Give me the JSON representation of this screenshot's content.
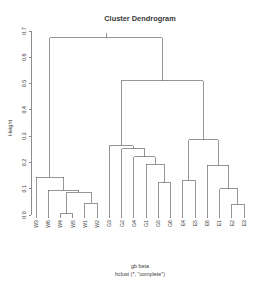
{
  "chart_data": {
    "type": "dendrogram",
    "title": "Cluster Dendrogram",
    "xlabel": "",
    "ylabel": "Height",
    "caption": {
      "line1": "gb beta",
      "line2": "hclust (*, \"complete\")"
    },
    "ylim": [
      0.0,
      0.7
    ],
    "yticks": [
      "0.0",
      "0.1",
      "0.2",
      "0.3",
      "0.4",
      "0.5",
      "0.6",
      "0.7"
    ],
    "ytick_values": [
      0.0,
      0.1,
      0.2,
      0.3,
      0.4,
      0.5,
      0.6,
      0.7
    ],
    "grid": false,
    "legend": "none",
    "leaf_order": [
      "W3",
      "W6",
      "W4",
      "W5",
      "W1",
      "W2",
      "G3",
      "G2",
      "G4",
      "G1",
      "G5",
      "G6",
      "E4",
      "E5",
      "E6",
      "E1",
      "E2",
      "E3"
    ],
    "leaf_count": 18,
    "merges": [
      {
        "id": "m1",
        "left": "W4",
        "right": "W5",
        "height": 0.005
      },
      {
        "id": "m2",
        "left": "W1",
        "right": "W2",
        "height": 0.044
      },
      {
        "id": "m3",
        "left": "m1",
        "right": "m2",
        "height": 0.086
      },
      {
        "id": "m4",
        "left": "W6",
        "right": "m3",
        "height": 0.095
      },
      {
        "id": "m5",
        "left": "W3",
        "right": "m4",
        "height": 0.144
      },
      {
        "id": "m6",
        "left": "G5",
        "right": "G6",
        "height": 0.122
      },
      {
        "id": "m7",
        "left": "G1",
        "right": "m6",
        "height": 0.194
      },
      {
        "id": "m8",
        "left": "G4",
        "right": "m7",
        "height": 0.222
      },
      {
        "id": "m9",
        "left": "G2",
        "right": "m8",
        "height": 0.253
      },
      {
        "id": "m10",
        "left": "G3",
        "right": "m9",
        "height": 0.263
      },
      {
        "id": "m11",
        "left": "E4",
        "right": "E5",
        "height": 0.133
      },
      {
        "id": "m12",
        "left": "E2",
        "right": "E3",
        "height": 0.04
      },
      {
        "id": "m13",
        "left": "E1",
        "right": "m12",
        "height": 0.1
      },
      {
        "id": "m14",
        "left": "E6",
        "right": "m13",
        "height": 0.19
      },
      {
        "id": "m15",
        "left": "m11",
        "right": "m14",
        "height": 0.286
      },
      {
        "id": "m16",
        "left": "m10",
        "right": "m15",
        "height": 0.51
      },
      {
        "id": "m17",
        "left": "m5",
        "right": "m16",
        "height": 0.675
      }
    ],
    "clusters": {
      "W": [
        "W3",
        "W6",
        "W4",
        "W5",
        "W1",
        "W2"
      ],
      "G": [
        "G3",
        "G2",
        "G4",
        "G1",
        "G5",
        "G6"
      ],
      "E": [
        "E4",
        "E5",
        "E6",
        "E1",
        "E2",
        "E3"
      ]
    }
  },
  "colors": {
    "background": "#ffffff",
    "line": "#6a6a6a",
    "axis": "#5d5d5d",
    "text": "#3a3a3a"
  }
}
